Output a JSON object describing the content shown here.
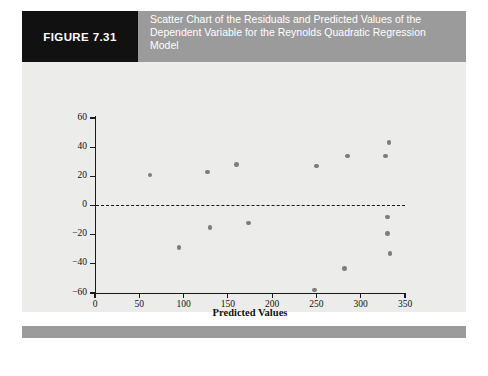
{
  "figure": {
    "tag": "FIGURE 7.31",
    "caption": "Scatter Chart of the Residuals and Predicted Values of the Dependent Variable for the Reynolds Quadratic Regression Model",
    "tag_background": "#111111",
    "band_background": "#9b9b9b",
    "panel_background": "#ececea"
  },
  "chart_data": {
    "type": "scatter",
    "title": "",
    "xlabel": "Predicted Values",
    "ylabel": "Residuals",
    "xlim": [
      0,
      350
    ],
    "ylim": [
      -60,
      60
    ],
    "xticks": [
      0,
      50,
      100,
      150,
      200,
      250,
      300,
      350
    ],
    "yticks": [
      -60,
      -40,
      -20,
      0,
      20,
      40,
      60
    ],
    "grid": false,
    "legend": null,
    "reference_line": {
      "y": 0,
      "style": "dashed",
      "color": "#1a1a1a"
    },
    "marker_color": "#7d7d80",
    "series": [
      {
        "name": "Residuals vs Predicted Values",
        "points": [
          [
            62,
            21
          ],
          [
            95,
            -29
          ],
          [
            127,
            23
          ],
          [
            130,
            -15
          ],
          [
            160,
            28
          ],
          [
            173,
            -12
          ],
          [
            248,
            -58
          ],
          [
            250,
            27
          ],
          [
            282,
            -43
          ],
          [
            285,
            34
          ],
          [
            328,
            34
          ],
          [
            330,
            -8
          ],
          [
            330,
            -19
          ],
          [
            332,
            43
          ],
          [
            333,
            -33
          ]
        ]
      }
    ]
  }
}
